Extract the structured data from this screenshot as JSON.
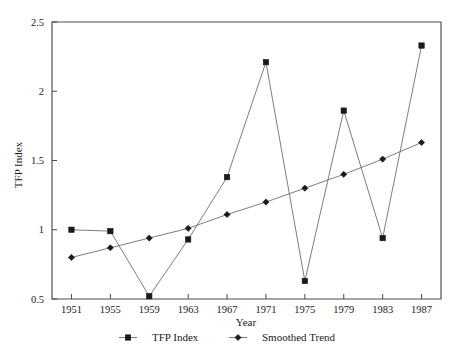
{
  "chart_data": {
    "type": "line",
    "title": "",
    "xlabel": "Year",
    "ylabel": "TFP Index",
    "x": [
      1951,
      1955,
      1959,
      1963,
      1967,
      1971,
      1975,
      1979,
      1983,
      1987
    ],
    "categories": [
      "1951",
      "1955",
      "1959",
      "1963",
      "1967",
      "1971",
      "1975",
      "1979",
      "1983",
      "1987"
    ],
    "xlim": [
      1949,
      1989
    ],
    "ylim": [
      0.5,
      2.5
    ],
    "yticks": [
      0.5,
      1,
      1.5,
      2,
      2.5
    ],
    "ytick_labels": [
      "0.5",
      "1",
      "1.5",
      "2",
      "2.5"
    ],
    "xticks": [
      1951,
      1955,
      1959,
      1963,
      1967,
      1971,
      1975,
      1979,
      1983,
      1987
    ],
    "xtick_labels": [
      "1951",
      "1955",
      "1959",
      "1963",
      "1967",
      "1971",
      "1975",
      "1979",
      "1983",
      "1987"
    ],
    "grid": false,
    "legend_position": "bottom",
    "series": [
      {
        "name": "TFP Index",
        "marker": "square",
        "color": "#1a1a1a",
        "values": [
          1.0,
          0.99,
          0.52,
          0.93,
          1.38,
          2.21,
          0.63,
          1.86,
          0.94,
          2.33
        ]
      },
      {
        "name": "Smoothed Trend",
        "marker": "diamond",
        "color": "#1a1a1a",
        "values": [
          0.8,
          0.87,
          0.94,
          1.01,
          1.11,
          1.2,
          1.3,
          1.4,
          1.51,
          1.63
        ]
      }
    ]
  },
  "axes": {
    "y_title": "TFP Index",
    "x_title": "Year"
  },
  "legend": {
    "entries": [
      {
        "label": "TFP Index",
        "marker": "square"
      },
      {
        "label": "Smoothed Trend",
        "marker": "diamond"
      }
    ]
  },
  "colors": {
    "line": "#6e6e6e",
    "marker": "#1a1a1a",
    "frame": "#4a4a4a",
    "background": "#ffffff"
  }
}
